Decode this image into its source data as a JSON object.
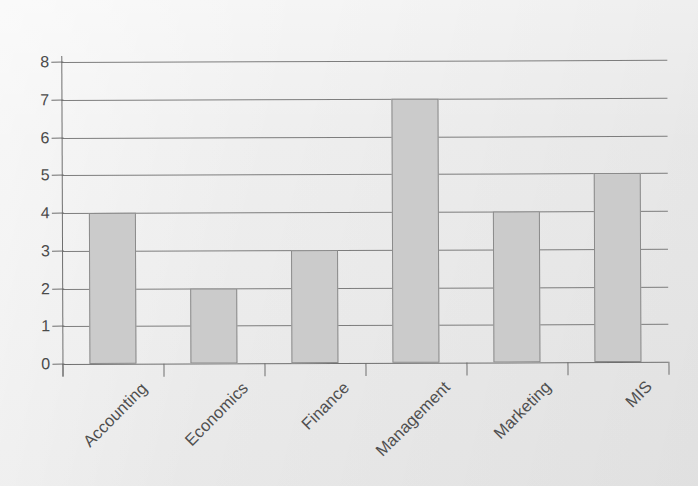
{
  "chart_data": {
    "type": "bar",
    "title": "",
    "subtitle": "",
    "xlabel": "",
    "ylabel": "",
    "categories": [
      "Accounting",
      "Economics",
      "Finance",
      "Management",
      "Marketing",
      "MIS"
    ],
    "values": [
      4,
      2,
      3,
      7,
      4,
      5
    ],
    "ylim": [
      0,
      8
    ],
    "ytick_labels": [
      "0",
      "1",
      "2",
      "3",
      "4",
      "5",
      "6",
      "7",
      "8"
    ],
    "ytick_values": [
      0,
      1,
      2,
      3,
      4,
      5,
      6,
      7,
      8
    ],
    "grid": true,
    "grid_axis": "y",
    "legend": false,
    "legend_position": "none",
    "annotations": [],
    "colors": {
      "background": "#ececec",
      "bar_fill": "#cbcbcb",
      "bar_border": "#8b8b8b",
      "gridline": "#7d7d7d",
      "axis": "#6f6f6f",
      "tick_label": "#4a4a4a",
      "category_label": "#4f4f4f"
    },
    "xtick_label_rotation": -45
  }
}
